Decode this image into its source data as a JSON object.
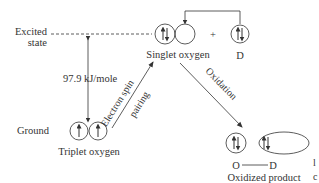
{
  "diagram": {
    "levels": {
      "excited_line1": "Excited",
      "excited_line2": "state",
      "ground": "Ground"
    },
    "energy_gap": "97.9 kJ/mole",
    "species": {
      "triplet": "Triplet oxygen",
      "singlet": "Singlet oxygen",
      "donor": "D",
      "plus": "+",
      "oxidized_product": "Oxidized product",
      "bond_left": "O",
      "bond_right": "D"
    },
    "transitions": {
      "spin_pairing_line1": "Electron spin",
      "spin_pairing_line2": "pairing",
      "oxidation": "Oxidation"
    },
    "margin_marks": {
      "top": "l",
      "bottom": "c"
    },
    "colors": {
      "line": "#333333",
      "text": "#333333",
      "background": "#ffffff"
    }
  }
}
